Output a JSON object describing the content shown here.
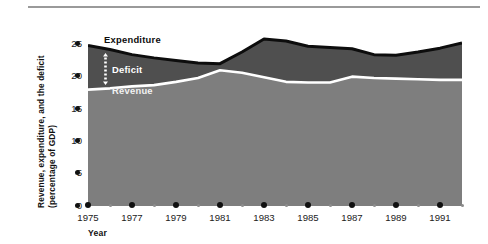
{
  "figure": {
    "y_axis_title_line1": "Revenue, expenditure, and the deficit",
    "y_axis_title_line2": "(percentage of GDP)",
    "x_axis_title": "Year",
    "series_labels": {
      "expenditure": "Expenditure",
      "deficit": "Deficit",
      "revenue": "Revenue"
    },
    "colors": {
      "expenditure_line": "#0d0d0d",
      "deficit_band": "#4f4f4f",
      "revenue_band": "#7e7e7e",
      "revenue_line": "#ffffff",
      "axis": "#8d8d8d",
      "text": "#1b1b1b",
      "top_rule": "#9a9a9a",
      "background": "#ffffff"
    },
    "icons": {
      "deficit_arrow": "dotted-double-arrow-icon"
    }
  },
  "chart_data": {
    "type": "area",
    "title": "",
    "subtitle": "",
    "xlabel": "Year",
    "ylabel": "Revenue, expenditure, and the deficit (percentage of GDP)",
    "xlim": [
      1975,
      1992
    ],
    "ylim": [
      0,
      27
    ],
    "yticks": [
      0,
      5,
      10,
      15,
      20,
      25
    ],
    "ytick_labels": [
      "0",
      "5",
      "10",
      "15",
      "20",
      "25"
    ],
    "xticks": [
      1975,
      1977,
      1979,
      1981,
      1983,
      1985,
      1987,
      1989,
      1991
    ],
    "xtick_labels": [
      "1975",
      "1977",
      "1979",
      "1981",
      "1983",
      "1985",
      "1987",
      "1989",
      "1991"
    ],
    "xticks_minor": [
      1976,
      1978,
      1980,
      1982,
      1984,
      1986,
      1988,
      1990,
      1992
    ],
    "grid": false,
    "legend": "in-plot labels",
    "stacked": true,
    "x": [
      1975,
      1976,
      1977,
      1978,
      1979,
      1980,
      1981,
      1982,
      1983,
      1984,
      1985,
      1986,
      1987,
      1988,
      1989,
      1990,
      1991,
      1992
    ],
    "series": [
      {
        "name": "Revenue",
        "values": [
          17.8,
          18.0,
          18.3,
          18.5,
          19.0,
          19.6,
          20.8,
          20.4,
          19.7,
          19.0,
          18.9,
          18.9,
          19.8,
          19.6,
          19.5,
          19.4,
          19.3,
          19.3
        ]
      },
      {
        "name": "Expenditure",
        "values": [
          24.6,
          24.0,
          23.2,
          22.7,
          22.3,
          21.9,
          21.8,
          23.6,
          25.6,
          25.3,
          24.5,
          24.3,
          24.1,
          23.2,
          23.1,
          23.6,
          24.2,
          25.0
        ]
      },
      {
        "name": "Deficit",
        "values": [
          6.8,
          6.0,
          4.9,
          4.2,
          3.3,
          2.3,
          1.0,
          3.2,
          5.9,
          6.3,
          5.6,
          5.4,
          4.3,
          3.6,
          3.6,
          4.2,
          4.9,
          5.7
        ]
      }
    ],
    "annotations": [
      {
        "text": "Expenditure",
        "x": 1976.8,
        "y": 25.9
      },
      {
        "text": "Deficit",
        "x": 1977.2,
        "y": 21.5
      },
      {
        "text": "Revenue",
        "x": 1977.2,
        "y": 18.3
      }
    ]
  }
}
